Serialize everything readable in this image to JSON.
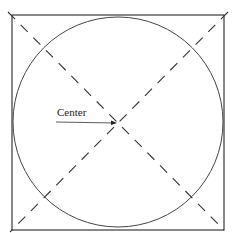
{
  "diagram": {
    "label_center": "Center",
    "stroke_color": "#3a3a3a",
    "square": {
      "x": 12,
      "y": 15,
      "w": 212,
      "h": 215
    },
    "circle": {
      "cx": 118,
      "cy": 122,
      "r": 105
    },
    "diagonals": [
      {
        "x1": 8,
        "y1": 12,
        "x2": 224,
        "y2": 230
      },
      {
        "x1": 228,
        "y1": 12,
        "x2": 10,
        "y2": 232
      }
    ],
    "arrow": {
      "x1": 56,
      "y1": 122,
      "x2": 116,
      "y2": 123
    }
  }
}
